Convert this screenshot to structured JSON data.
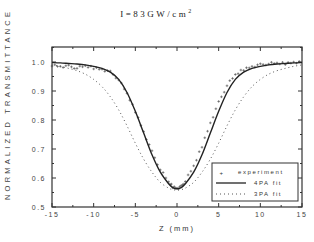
{
  "chart_data": {
    "type": "line",
    "title": "I=83GW/cm",
    "title_superscript": "2",
    "xlabel": "Z (mm)",
    "ylabel": "NORMALIZED TRANSMITTANCE",
    "xlim": [
      -15,
      15
    ],
    "ylim": [
      0.5,
      1.05
    ],
    "xticks": [
      -15,
      -10,
      -5,
      0,
      5,
      10,
      15
    ],
    "xtick_labels": [
      "-15",
      "-10",
      "-5",
      "0",
      "5",
      "10",
      "15"
    ],
    "yticks": [
      0.5,
      0.6,
      0.7,
      0.8,
      0.9,
      1.0
    ],
    "ytick_labels": [
      "0.5",
      "0.6",
      "0.7",
      "0.8",
      "0.9",
      "1.0"
    ],
    "grid": false,
    "legend_position": "lower right",
    "series": [
      {
        "name": "experiment",
        "style": "markers-plus",
        "x": [
          -15,
          -14,
          -13,
          -12,
          -11,
          -10,
          -9,
          -8,
          -7,
          -6,
          -5,
          -4,
          -3,
          -2,
          -1,
          -0.5,
          0,
          0.5,
          1,
          2,
          3,
          4,
          5,
          6,
          7,
          8,
          9,
          10,
          11,
          12,
          13,
          14,
          15
        ],
        "y": [
          0.99,
          0.985,
          0.985,
          0.98,
          0.985,
          0.98,
          0.975,
          0.965,
          0.94,
          0.89,
          0.83,
          0.76,
          0.69,
          0.63,
          0.585,
          0.57,
          0.565,
          0.57,
          0.59,
          0.64,
          0.71,
          0.79,
          0.86,
          0.92,
          0.955,
          0.975,
          0.985,
          0.99,
          0.995,
          0.995,
          0.995,
          1.0,
          1.0
        ]
      },
      {
        "name": "4PA fit",
        "style": "solid",
        "x": [
          -15,
          -14,
          -13,
          -12,
          -11,
          -10,
          -9,
          -8,
          -7,
          -6,
          -5,
          -4,
          -3,
          -2,
          -1,
          -0.5,
          0,
          0.5,
          1,
          2,
          3,
          4,
          5,
          6,
          7,
          8,
          9,
          10,
          11,
          12,
          13,
          14,
          15
        ],
        "y": [
          0.998,
          0.997,
          0.995,
          0.993,
          0.99,
          0.985,
          0.978,
          0.965,
          0.94,
          0.895,
          0.83,
          0.755,
          0.68,
          0.62,
          0.58,
          0.567,
          0.563,
          0.567,
          0.58,
          0.62,
          0.68,
          0.755,
          0.83,
          0.895,
          0.94,
          0.965,
          0.978,
          0.985,
          0.99,
          0.993,
          0.995,
          0.997,
          0.998
        ]
      },
      {
        "name": "3PA fit",
        "style": "dotted",
        "x": [
          -15,
          -14,
          -13,
          -12,
          -11,
          -10,
          -9,
          -8,
          -7,
          -6,
          -5,
          -4,
          -3,
          -2,
          -1,
          -0.5,
          0,
          0.5,
          1,
          2,
          3,
          4,
          5,
          6,
          7,
          8,
          9,
          10,
          11,
          12,
          13,
          14,
          15
        ],
        "y": [
          0.99,
          0.985,
          0.978,
          0.97,
          0.958,
          0.94,
          0.915,
          0.88,
          0.835,
          0.78,
          0.72,
          0.665,
          0.62,
          0.585,
          0.565,
          0.56,
          0.558,
          0.56,
          0.565,
          0.585,
          0.62,
          0.665,
          0.72,
          0.78,
          0.835,
          0.88,
          0.915,
          0.94,
          0.958,
          0.97,
          0.978,
          0.985,
          0.99
        ]
      }
    ]
  },
  "legend": {
    "items": [
      {
        "label": "experiment",
        "symbol": "+"
      },
      {
        "label": "4PA fit",
        "symbol": "solid-line"
      },
      {
        "label": "3PA fit",
        "symbol": "dotted-line"
      }
    ]
  },
  "colors": {
    "axis": "#333333",
    "line": "#222222",
    "background": "#ffffff"
  }
}
